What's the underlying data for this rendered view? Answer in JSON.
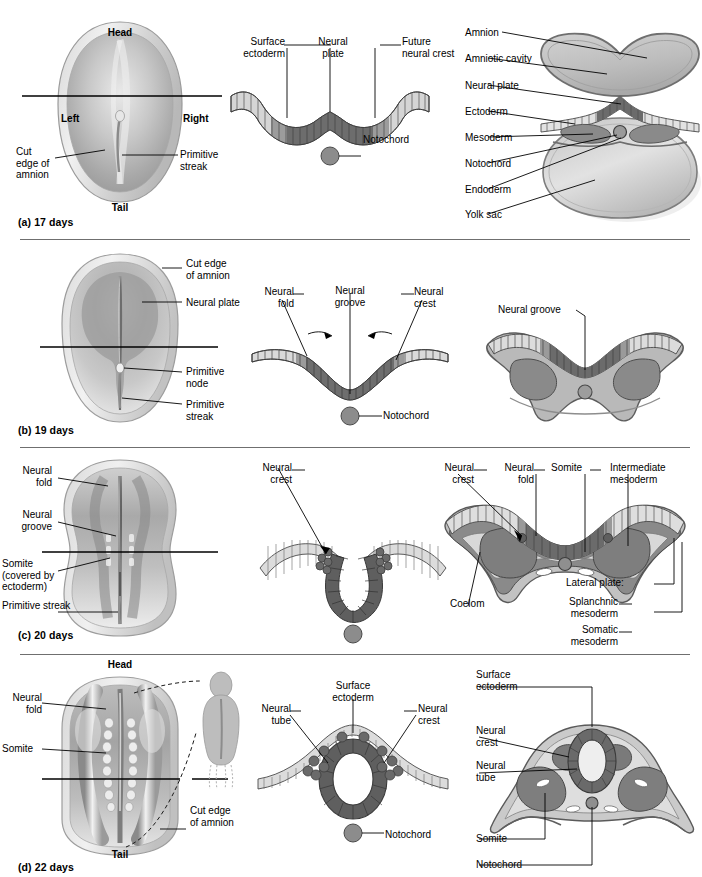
{
  "figure": {
    "palette": {
      "ectoderm_light": "#cfcfcf",
      "neural_dark": "#6f6f6f",
      "mesoderm_mid": "#8f8f8f",
      "amnion_outline": "#7a7a7a",
      "yolk_sac": "#b4b4b4",
      "background": "#ffffff",
      "divider": "#6f6f6f",
      "text": "#000000"
    }
  },
  "rows": [
    {
      "id": "a",
      "caption": "(a) 17 days",
      "dorsal_view": {
        "name": "dorsal-view-17-days",
        "orientation": {
          "head": "Head",
          "tail": "Tail",
          "left": "Left",
          "right": "Right"
        },
        "labels": [
          {
            "text": "Cut\nedge of\namnion",
            "lines": [
              "Cut",
              "edge of",
              "amnion"
            ]
          },
          {
            "text": "Primitive\nstreak",
            "lines": [
              "Primitive",
              "streak"
            ]
          }
        ]
      },
      "cross_section_simple": {
        "name": "neural-plate-cross-section",
        "labels": [
          {
            "text": "Surface\nectoderm",
            "lines": [
              "Surface",
              "ectoderm"
            ]
          },
          {
            "text": "Neural\nplate",
            "lines": [
              "Neural",
              "plate"
            ]
          },
          {
            "text": "Future\nneural crest",
            "lines": [
              "Future",
              "neural crest"
            ]
          },
          {
            "text": "Notochord",
            "lines": [
              "Notochord"
            ]
          }
        ]
      },
      "cross_section_full": {
        "name": "embryo-with-amnion-cross-section",
        "labels": [
          "Amnion",
          "Amniotic cavity",
          "Neural plate",
          "Ectoderm",
          "Mesoderm",
          "Notochord",
          "Endoderm",
          "Yolk sac"
        ]
      }
    },
    {
      "id": "b",
      "caption": "(b) 19 days",
      "dorsal_view": {
        "name": "dorsal-view-19-days",
        "labels": [
          {
            "lines": [
              "Cut edge",
              "of amnion"
            ]
          },
          {
            "lines": [
              "Neural plate"
            ]
          },
          {
            "lines": [
              "Primitive",
              "node"
            ]
          },
          {
            "lines": [
              "Primitive",
              "streak"
            ]
          }
        ]
      },
      "cross_section_simple": {
        "name": "neural-groove-cross-section",
        "labels": [
          {
            "lines": [
              "Neural",
              "fold"
            ]
          },
          {
            "lines": [
              "Neural",
              "groove"
            ]
          },
          {
            "lines": [
              "Neural",
              "crest"
            ]
          },
          {
            "lines": [
              "Notochord"
            ]
          }
        ]
      },
      "cross_section_full": {
        "name": "neural-groove-full-cross-section",
        "labels": [
          "Neural groove"
        ]
      }
    },
    {
      "id": "c",
      "caption": "(c) 20 days",
      "dorsal_view": {
        "name": "dorsal-view-20-days",
        "labels": [
          {
            "lines": [
              "Neural",
              "fold"
            ]
          },
          {
            "lines": [
              "Neural",
              "groove"
            ]
          },
          {
            "lines": [
              "Somite",
              "(covered by",
              "ectoderm)"
            ]
          },
          {
            "lines": [
              "Primitive streak"
            ]
          }
        ]
      },
      "cross_section_simple": {
        "name": "neural-crest-cross-section",
        "labels": [
          {
            "lines": [
              "Neural",
              "crest"
            ]
          }
        ]
      },
      "cross_section_full": {
        "name": "somite-mesoderm-cross-section",
        "labels": [
          {
            "lines": [
              "Neural",
              "crest"
            ]
          },
          {
            "lines": [
              "Neural",
              "fold"
            ]
          },
          {
            "lines": [
              "Somite"
            ]
          },
          {
            "lines": [
              "Intermediate",
              "mesoderm"
            ]
          },
          {
            "lines": [
              "Coelom"
            ]
          },
          {
            "lines": [
              "Lateral plate:"
            ]
          },
          {
            "lines": [
              "Splanchnic",
              "mesoderm"
            ]
          },
          {
            "lines": [
              "Somatic",
              "mesoderm"
            ]
          }
        ]
      }
    },
    {
      "id": "d",
      "caption": "(d) 22 days",
      "dorsal_view": {
        "name": "dorsal-view-22-days",
        "orientation": {
          "head": "Head",
          "tail": "Tail"
        },
        "labels": [
          {
            "lines": [
              "Neural",
              "fold"
            ]
          },
          {
            "lines": [
              "Somite"
            ]
          },
          {
            "lines": [
              "Cut edge",
              "of amnion"
            ]
          }
        ],
        "inset": {
          "name": "fetus-silhouette-inset"
        }
      },
      "cross_section_simple": {
        "name": "neural-tube-cross-section",
        "labels": [
          {
            "lines": [
              "Neural",
              "tube"
            ]
          },
          {
            "lines": [
              "Surface",
              "ectoderm"
            ]
          },
          {
            "lines": [
              "Neural",
              "crest"
            ]
          },
          {
            "lines": [
              "Notochord"
            ]
          }
        ]
      },
      "cross_section_full": {
        "name": "neural-tube-full-cross-section",
        "labels": [
          {
            "lines": [
              "Surface",
              "ectoderm"
            ]
          },
          {
            "lines": [
              "Neural",
              "crest"
            ]
          },
          {
            "lines": [
              "Neural",
              "tube"
            ]
          },
          {
            "lines": [
              "Somite"
            ]
          },
          {
            "lines": [
              "Notochord"
            ]
          }
        ]
      }
    }
  ]
}
